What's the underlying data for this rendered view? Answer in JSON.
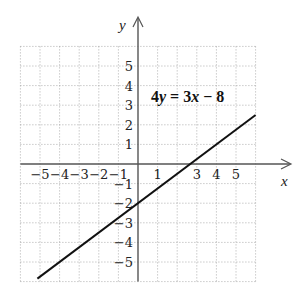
{
  "chart_data": {
    "type": "line",
    "title": "",
    "annotation": "4y = 3x − 8",
    "annotation_parts": {
      "lhs_coef": "4",
      "lhs_var": "y",
      "eq": " = ",
      "rhs_coef": "3",
      "rhs_var": "x",
      "rest": " − 8"
    },
    "xlabel": "x",
    "ylabel": "y",
    "xlim": [
      -6,
      6
    ],
    "ylim": [
      -6,
      6
    ],
    "grid": true,
    "grid_style": "dotted",
    "x_tick_labels": [
      "−5",
      "−4",
      "−3",
      "−2",
      "−1",
      "1",
      "3",
      "4",
      "5"
    ],
    "x_tick_values": [
      -5,
      -4,
      -3,
      -2,
      -1,
      1,
      3,
      4,
      5
    ],
    "y_tick_labels": [
      "5",
      "4",
      "3",
      "2",
      "1",
      "−1",
      "−2",
      "−3",
      "−4",
      "−5"
    ],
    "y_tick_values": [
      5,
      4,
      3,
      2,
      1,
      -1,
      -2,
      -3,
      -4,
      -5
    ],
    "series": [
      {
        "name": "4y = 3x − 8",
        "equation": "y = 0.75x − 2",
        "slope": 0.75,
        "intercept": -2,
        "x": [
          -5.5,
          6
        ],
        "values": [
          -6.125,
          2.5
        ]
      }
    ],
    "key_points": [
      {
        "label": "y-intercept",
        "x": 0,
        "y": -2
      },
      {
        "label": "x-intercept",
        "x": 2.667,
        "y": 0
      }
    ],
    "legend": null
  }
}
